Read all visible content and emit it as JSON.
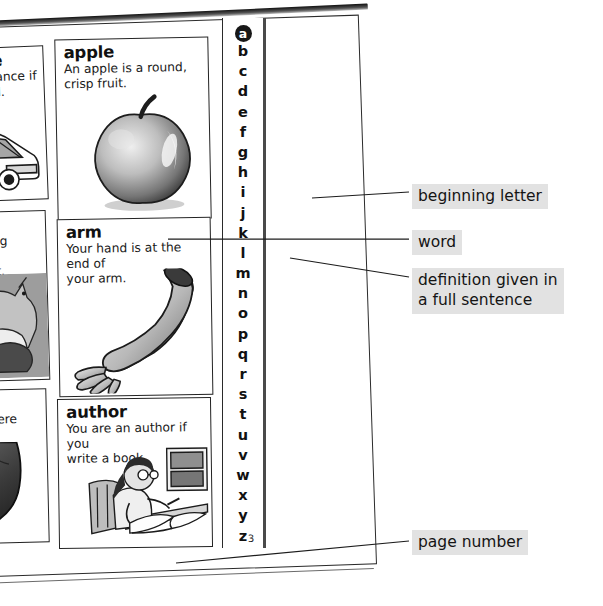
{
  "document": {
    "type": "dictionary-page-spread",
    "page_number": "3",
    "current_letter_tab": "a"
  },
  "entries": [
    {
      "id": "ambulance",
      "word": "ambulance",
      "definition": "You go in an ambulance if you are ill or injured.",
      "definition_lines": [
        "go in an ambulance if",
        "are ill or injured."
      ],
      "illustration": "ambulance-illustration"
    },
    {
      "id": "apple",
      "word": "apple",
      "definition": "An apple is a round, crisp fruit.",
      "definition_lines": [
        "An apple is a round,",
        "crisp fruit."
      ],
      "illustration": "apple-illustration"
    },
    {
      "id": "animal",
      "word": "animal",
      "definition": "An animal is a living thing that is not a plant.",
      "definition_lines": [
        "animal is a living thing",
        "at is not a plant."
      ],
      "illustration": "animals-group-illustration"
    },
    {
      "id": "arm",
      "word": "arm",
      "definition": "Your hand is at the end of your arm.",
      "definition_lines": [
        "Your hand is at the end of",
        "your arm."
      ],
      "illustration": "arm-illustration"
    },
    {
      "id": "ankle",
      "word": "ankle",
      "definition": "Your ankle is where your leg joins your foot.",
      "definition_lines": [
        "our ankle is where your",
        "eg joins your foot."
      ],
      "illustration": "foot-ankle-illustration"
    },
    {
      "id": "author",
      "word": "author",
      "definition": "You are an author if you write a book.",
      "definition_lines": [
        "You are an author if you",
        "write a book."
      ],
      "illustration": "author-writing-illustration"
    }
  ],
  "alphabet_strip": {
    "letters": [
      "a",
      "b",
      "c",
      "d",
      "e",
      "f",
      "g",
      "h",
      "i",
      "j",
      "k",
      "l",
      "m",
      "n",
      "o",
      "p",
      "q",
      "r",
      "s",
      "t",
      "u",
      "v",
      "w",
      "x",
      "y",
      "z"
    ],
    "highlighted": "a"
  },
  "annotations": [
    {
      "id": "beginning-letter",
      "label": "beginning letter",
      "points_to": "alphabet-strip-letter-i"
    },
    {
      "id": "word",
      "label": "word",
      "points_to": "entry-arm-headword"
    },
    {
      "id": "definition",
      "label": "definition given in\na full sentence",
      "points_to": "entry-arm-definition"
    },
    {
      "id": "page-number",
      "label": "page number",
      "points_to": "page-number-3"
    }
  ],
  "colors": {
    "page_background": "#ffffff",
    "ink": "#111111",
    "box_border": "#232323",
    "callout_background": "#e2e2e2",
    "tab_highlight": "#171717",
    "canvas": "#ffffff"
  }
}
